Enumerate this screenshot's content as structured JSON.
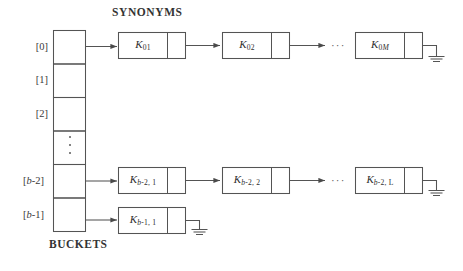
{
  "figure": {
    "title": "SYNONYMS",
    "caption": "BUCKETS",
    "ellipsis": "···",
    "colors": {
      "stroke": "#4a4a4a",
      "text": "#333333",
      "background": "#ffffff"
    }
  },
  "buckets": {
    "label_items": [
      {
        "text": "[0]",
        "index": 0
      },
      {
        "text": "[1]",
        "index": 1
      },
      {
        "text": "[2]",
        "index": 2
      },
      {
        "text": "",
        "index": 3
      },
      {
        "text": "[b-2]",
        "index": 4
      },
      {
        "text": "[b-1]",
        "index": 5
      }
    ],
    "vertical_ellipsis": "⋮"
  },
  "chains": [
    {
      "bucket": "[0]",
      "nodes": [
        {
          "key": "K",
          "sub": "01",
          "terminator": false
        },
        {
          "key": "K",
          "sub": "02",
          "terminator": false
        },
        {
          "key": "K",
          "sub": "0M",
          "terminator": true
        }
      ],
      "has_ellipsis": true
    },
    {
      "bucket": "[b-2]",
      "nodes": [
        {
          "key": "K",
          "sub": "b-2, 1",
          "terminator": false
        },
        {
          "key": "K",
          "sub": "b-2, 2",
          "terminator": false
        },
        {
          "key": "K",
          "sub": "b-2, L",
          "terminator": true
        }
      ],
      "has_ellipsis": true
    },
    {
      "bucket": "[b-1]",
      "nodes": [
        {
          "key": "K",
          "sub": "b-1, 1",
          "terminator": true
        }
      ],
      "has_ellipsis": false
    }
  ],
  "node_labels": {
    "r0n0": "K01",
    "r0n1": "K02",
    "r0n2": "K0M",
    "r1n0": "Kb-2, 1",
    "r1n1": "Kb-2, 2",
    "r1n2": "Kb-2, L",
    "r2n0": "Kb-1, 1"
  },
  "key_glyph": "K",
  "subscripts": {
    "r0n0": "01",
    "r0n1": "02",
    "r0n2_num": "0",
    "r0n2_italic": "M",
    "r1n0_italic": "b",
    "r1n0_rest": "-2, 1",
    "r1n1_rest": "-2, 2",
    "r1n2_rest": "-2, L",
    "r2n0_rest": "-1, 1"
  }
}
